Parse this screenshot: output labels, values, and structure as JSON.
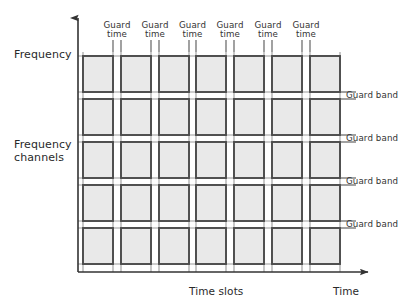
{
  "diagram": {
    "axes": {
      "y_axis_label": "Frequency",
      "y_axis_secondary_label": "Frequency\nchannels",
      "x_axis_label": "Time",
      "x_axis_secondary_label": "Time slots"
    },
    "guard_time_label": "Guard\ntime",
    "guard_time_line1": "Guard",
    "guard_time_line2": "time",
    "guard_band_label": "Guard band",
    "guard_time_labels": [
      "Guard time",
      "Guard time",
      "Guard time",
      "Guard time",
      "Guard time",
      "Guard time"
    ],
    "guard_band_labels": [
      "Guard band",
      "Guard band",
      "Guard band",
      "Guard band"
    ],
    "counts": {
      "time_slot_columns": 7,
      "frequency_channel_rows": 5,
      "guard_times": 6,
      "guard_bands": 4
    },
    "colors": {
      "background": "#ffffff",
      "cell_fill": "#e9e9e9",
      "cell_border": "#4a4a4a",
      "grid_line": "#9a9a9a",
      "axis": "#333333",
      "text": "#2a2a2a"
    }
  },
  "chart_data": {
    "type": "heatmap",
    "xlabel": "Time slots",
    "ylabel": "Frequency channels",
    "x_axis_arrow_label": "Time",
    "y_axis_arrow_label": "Frequency",
    "grid": true,
    "legend_position": "none",
    "categories_x": [
      "Slot 1",
      "Slot 2",
      "Slot 3",
      "Slot 4",
      "Slot 5",
      "Slot 6",
      "Slot 7"
    ],
    "categories_y": [
      "Ch 5",
      "Ch 4",
      "Ch 3",
      "Ch 2",
      "Ch 1"
    ],
    "separators_x": [
      "Guard time",
      "Guard time",
      "Guard time",
      "Guard time",
      "Guard time",
      "Guard time"
    ],
    "separators_y": [
      "Guard band",
      "Guard band",
      "Guard band",
      "Guard band"
    ],
    "values": [
      [
        1,
        1,
        1,
        1,
        1,
        1,
        1
      ],
      [
        1,
        1,
        1,
        1,
        1,
        1,
        1
      ],
      [
        1,
        1,
        1,
        1,
        1,
        1,
        1
      ],
      [
        1,
        1,
        1,
        1,
        1,
        1,
        1
      ],
      [
        1,
        1,
        1,
        1,
        1,
        1,
        1
      ]
    ],
    "geometry": {
      "plot_left": 78,
      "plot_right": 340,
      "plot_top": 52,
      "plot_bottom": 272,
      "col_starts": [
        83,
        121,
        159,
        196,
        234,
        272,
        310
      ],
      "col_width": 30,
      "col_gap": 8,
      "row_starts": [
        56,
        99,
        142,
        185,
        228
      ],
      "row_height": 36,
      "row_gap": 7
    }
  }
}
